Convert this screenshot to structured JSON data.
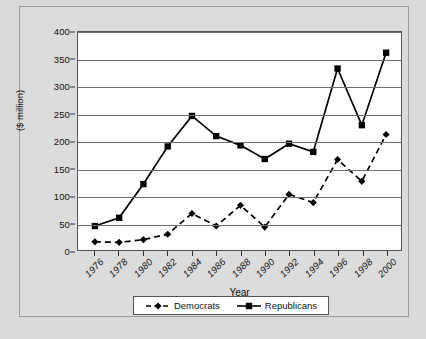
{
  "chart_data": {
    "type": "line",
    "title": "",
    "xlabel": "Year",
    "ylabel": "($ million)",
    "x": [
      1976,
      1978,
      1980,
      1982,
      1984,
      1986,
      1988,
      1990,
      1992,
      1994,
      1996,
      1998,
      2000
    ],
    "categories": [
      "1976",
      "1978",
      "1980",
      "1982",
      "1984",
      "1986",
      "1988",
      "1990",
      "1992",
      "1994",
      "1996",
      "1998",
      "2000"
    ],
    "xlim": [
      1975,
      2001
    ],
    "ylim": [
      0,
      400
    ],
    "ytick_labels": [
      "0",
      "50",
      "100",
      "150",
      "200",
      "250",
      "300",
      "350",
      "400"
    ],
    "ytick_values": [
      0,
      50,
      100,
      150,
      200,
      250,
      300,
      350,
      400
    ],
    "grid": true,
    "grid_axis": "y",
    "legend_position": "bottom",
    "series": [
      {
        "name": "Democrats",
        "marker": "diamond",
        "linestyle": "dashed",
        "color": "#000000",
        "values": [
          15,
          14,
          19,
          29,
          67,
          44,
          82,
          42,
          102,
          87,
          166,
          126,
          212
        ]
      },
      {
        "name": "Republicans",
        "marker": "square",
        "linestyle": "solid",
        "color": "#000000",
        "values": [
          44,
          59,
          121,
          190,
          246,
          209,
          192,
          167,
          195,
          180,
          333,
          229,
          362
        ]
      }
    ]
  },
  "legend": {
    "items": [
      {
        "label": "Democrats"
      },
      {
        "label": "Republicans"
      }
    ]
  },
  "axes": {
    "x_title": "Year",
    "y_title": "($ million)"
  },
  "colors": {
    "page_background": "#d9d9d9",
    "frame_border": "#9a9a9a",
    "plot_background": "#ffffff",
    "gridline": "#6e6e6e",
    "series_line": "#000000"
  }
}
